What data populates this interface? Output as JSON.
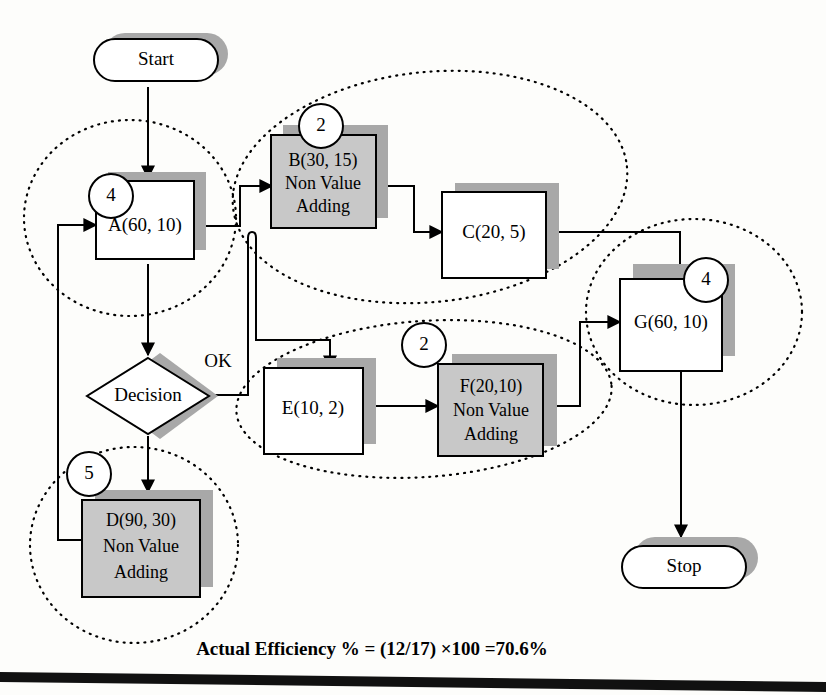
{
  "diagram": {
    "caption": "Actual Efficiency % = (12/17) ×100 =70.6%",
    "colors": {
      "non_value_fill": "#c8c8c8",
      "value_fill": "#ffffff",
      "shadow": "#a8a8a8",
      "stroke": "#000000"
    },
    "nodes": {
      "start": {
        "label": "Start",
        "type": "terminator"
      },
      "stop": {
        "label": "Stop",
        "type": "terminator"
      },
      "decision": {
        "label": "Decision",
        "type": "decision"
      },
      "a": {
        "label": "A(60, 10)",
        "type": "process",
        "value_adding": true
      },
      "b": {
        "line1": "B(30, 15)",
        "line2": "Non Value",
        "line3": "Adding",
        "type": "process",
        "value_adding": false
      },
      "c": {
        "label": "C(20, 5)",
        "type": "process",
        "value_adding": true
      },
      "d": {
        "line1": "D(90, 30)",
        "line2": "Non Value",
        "line3": "Adding",
        "type": "process",
        "value_adding": false
      },
      "e": {
        "label": "E(10, 2)",
        "type": "process",
        "value_adding": true
      },
      "f": {
        "line1": "F(20,10)",
        "line2": "Non Value",
        "line3": "Adding",
        "type": "process",
        "value_adding": false
      },
      "g": {
        "label": "G(60, 10)",
        "type": "process",
        "value_adding": true
      }
    },
    "badges": {
      "a": "4",
      "b": "2",
      "d": "5",
      "ef": "2",
      "g": "4"
    },
    "edge_labels": {
      "decision_ok": "OK"
    },
    "groups": [
      {
        "name": "group-a",
        "badge": "4"
      },
      {
        "name": "group-bc",
        "badge": "2"
      },
      {
        "name": "group-ef",
        "badge": "2"
      },
      {
        "name": "group-d",
        "badge": "5"
      },
      {
        "name": "group-g",
        "badge": "4"
      }
    ]
  }
}
